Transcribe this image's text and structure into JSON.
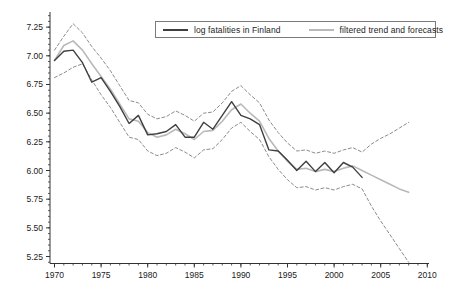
{
  "figure": {
    "background": "#ffffff",
    "axis_color": "#333333",
    "label_color": "#1a1a1a"
  },
  "legend": {
    "border_color": "#7a7a7a",
    "items": [
      {
        "label": "log fatalities in Finland",
        "color": "#3f3f3f",
        "style": "solid"
      },
      {
        "label": "filtered trend and forecasts",
        "color": "#b9b9b9",
        "style": "solid"
      }
    ]
  },
  "axes": {
    "y_tick_labels": [
      "5.25",
      "5.50",
      "5.75",
      "6.00",
      "6.25",
      "6.50",
      "6.75",
      "7.00",
      "7.25"
    ],
    "y_tick_values": [
      5.25,
      5.5,
      5.75,
      6.0,
      6.25,
      6.5,
      6.75,
      7.0,
      7.25
    ],
    "y_minor_step": 0.05,
    "x_tick_labels": [
      "1970",
      "1975",
      "1980",
      "1985",
      "1990",
      "1995",
      "2000",
      "2005",
      "2010"
    ],
    "x_tick_values": [
      1970,
      1975,
      1980,
      1985,
      1990,
      1995,
      2000,
      2005,
      2010
    ],
    "x_minor_step": 1
  },
  "chart_data": {
    "type": "line",
    "title": "",
    "xlabel": "",
    "ylabel": "",
    "xlim": [
      1969.5,
      2010.3
    ],
    "ylim": [
      5.19,
      7.38
    ],
    "grid": false,
    "legend_position": "top-right",
    "series": [
      {
        "name": "lower 90% confidence band",
        "color": "#8c8c8c",
        "dash": "3 2.4",
        "width": 1,
        "x": [
          1970,
          1971,
          1972,
          1973,
          1974,
          1975,
          1976,
          1977,
          1978,
          1979,
          1980,
          1981,
          1982,
          1983,
          1984,
          1985,
          1986,
          1987,
          1988,
          1989,
          1990,
          1991,
          1992,
          1993,
          1994,
          1995,
          1996,
          1997,
          1998,
          1999,
          2000,
          2001,
          2002,
          2003,
          2004,
          2005,
          2006,
          2007,
          2008
        ],
        "y": [
          6.81,
          6.85,
          6.9,
          6.93,
          6.79,
          6.66,
          6.55,
          6.42,
          6.29,
          6.27,
          6.17,
          6.13,
          6.15,
          6.2,
          6.16,
          6.11,
          6.18,
          6.19,
          6.27,
          6.37,
          6.42,
          6.34,
          6.27,
          6.12,
          6.01,
          5.92,
          5.85,
          5.86,
          5.83,
          5.85,
          5.83,
          5.86,
          5.88,
          5.84,
          5.69,
          5.56,
          5.44,
          5.32,
          5.2
        ]
      },
      {
        "name": "upper 90% confidence band",
        "color": "#8c8c8c",
        "dash": "3 2.4",
        "width": 1,
        "x": [
          1970,
          1971,
          1972,
          1973,
          1974,
          1975,
          1976,
          1977,
          1978,
          1979,
          1980,
          1981,
          1982,
          1983,
          1984,
          1985,
          1986,
          1987,
          1988,
          1989,
          1990,
          1991,
          1992,
          1993,
          1994,
          1995,
          1996,
          1997,
          1998,
          1999,
          2000,
          2001,
          2002,
          2003,
          2004,
          2005,
          2006,
          2007,
          2008
        ],
        "y": [
          7.05,
          7.17,
          7.28,
          7.2,
          7.08,
          6.98,
          6.87,
          6.74,
          6.61,
          6.59,
          6.49,
          6.45,
          6.47,
          6.52,
          6.48,
          6.43,
          6.5,
          6.51,
          6.59,
          6.69,
          6.74,
          6.66,
          6.59,
          6.44,
          6.33,
          6.24,
          6.17,
          6.18,
          6.15,
          6.17,
          6.15,
          6.18,
          6.2,
          6.16,
          6.23,
          6.28,
          6.32,
          6.37,
          6.42
        ]
      },
      {
        "name": "filtered trend and forecasts",
        "color": "#b9b9b9",
        "dash": "",
        "width": 1.6,
        "x": [
          1970,
          1971,
          1972,
          1973,
          1974,
          1975,
          1976,
          1977,
          1978,
          1979,
          1980,
          1981,
          1982,
          1983,
          1984,
          1985,
          1986,
          1987,
          1988,
          1989,
          1990,
          1991,
          1992,
          1993,
          1994,
          1995,
          1996,
          1997,
          1998,
          1999,
          2000,
          2001,
          2002,
          2003,
          2004,
          2005,
          2006,
          2007,
          2008
        ],
        "y": [
          6.96,
          7.09,
          7.13,
          7.05,
          6.93,
          6.82,
          6.71,
          6.58,
          6.45,
          6.43,
          6.33,
          6.29,
          6.31,
          6.36,
          6.32,
          6.27,
          6.34,
          6.35,
          6.43,
          6.53,
          6.58,
          6.5,
          6.43,
          6.28,
          6.17,
          6.08,
          6.01,
          6.02,
          5.99,
          6.01,
          5.99,
          6.02,
          6.04,
          6.0,
          5.96,
          5.92,
          5.88,
          5.84,
          5.81
        ]
      },
      {
        "name": "log fatalities in Finland",
        "color": "#3f3f3f",
        "dash": "",
        "width": 1.4,
        "x": [
          1970,
          1971,
          1972,
          1973,
          1974,
          1975,
          1976,
          1977,
          1978,
          1979,
          1980,
          1981,
          1982,
          1983,
          1984,
          1985,
          1986,
          1987,
          1988,
          1989,
          1990,
          1991,
          1992,
          1993,
          1994,
          1995,
          1996,
          1997,
          1998,
          1999,
          2000,
          2001,
          2002,
          2003
        ],
        "y": [
          6.96,
          7.04,
          7.05,
          6.94,
          6.77,
          6.81,
          6.69,
          6.56,
          6.41,
          6.48,
          6.31,
          6.32,
          6.34,
          6.4,
          6.29,
          6.29,
          6.42,
          6.36,
          6.48,
          6.6,
          6.48,
          6.45,
          6.4,
          6.18,
          6.17,
          6.09,
          6.0,
          6.08,
          5.99,
          6.07,
          5.98,
          6.07,
          6.03,
          5.94
        ]
      }
    ]
  }
}
